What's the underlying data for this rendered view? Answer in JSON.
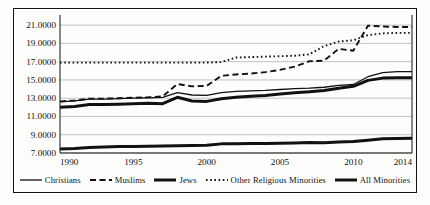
{
  "chart_data": {
    "type": "line",
    "title": "",
    "subtitle": "",
    "xlabel": "",
    "ylabel": "",
    "xlim": [
      1990,
      2014
    ],
    "ylim": [
      7.0,
      22.0
    ],
    "ytick_labels": [
      "21.0000",
      "19.0000",
      "17.0000",
      "15.0000",
      "13.0000",
      "11.0000",
      "9.0000",
      "7.0000"
    ],
    "ytick_values": [
      21.0,
      19.0,
      17.0,
      15.0,
      13.0,
      11.0,
      9.0,
      7.0
    ],
    "xtick_labels": [
      "1990",
      "1995",
      "2000",
      "2005",
      "2010",
      "2014"
    ],
    "xtick_values": [
      1990,
      1995,
      2000,
      2005,
      2010,
      2014
    ],
    "grid": "horizontal",
    "legend_position": "bottom",
    "x": [
      1990,
      1991,
      1992,
      1993,
      1994,
      1995,
      1996,
      1997,
      1998,
      1999,
      2000,
      2001,
      2002,
      2003,
      2004,
      2005,
      2006,
      2007,
      2008,
      2009,
      2010,
      2011,
      2012,
      2013,
      2014
    ],
    "series": [
      {
        "name": "Christians",
        "style": "solid-thin",
        "color": "#111111",
        "values": [
          12.6,
          12.7,
          12.9,
          12.9,
          12.95,
          13.0,
          13.05,
          13.1,
          13.6,
          13.35,
          13.3,
          13.6,
          13.75,
          13.8,
          13.85,
          13.95,
          14.05,
          14.1,
          14.2,
          14.4,
          14.5,
          15.35,
          15.8,
          15.9,
          15.9
        ]
      },
      {
        "name": "Muslims",
        "style": "dashed",
        "color": "#111111",
        "values": [
          12.65,
          12.75,
          12.95,
          12.95,
          13.0,
          13.05,
          13.1,
          13.2,
          14.55,
          14.3,
          14.35,
          15.45,
          15.6,
          15.7,
          15.85,
          16.1,
          16.45,
          17.05,
          17.1,
          18.4,
          18.2,
          20.95,
          20.85,
          20.8,
          20.8
        ]
      },
      {
        "name": "Jews",
        "style": "solid-thick",
        "color": "#111111",
        "values": [
          7.45,
          7.5,
          7.6,
          7.65,
          7.7,
          7.72,
          7.75,
          7.78,
          7.8,
          7.82,
          7.85,
          8.0,
          8.02,
          8.03,
          8.05,
          8.07,
          8.1,
          8.15,
          8.12,
          8.2,
          8.25,
          8.4,
          8.55,
          8.6,
          8.62
        ]
      },
      {
        "name": "Other Religious Minorities",
        "style": "dotted",
        "color": "#111111",
        "values": [
          16.9,
          16.9,
          16.9,
          16.9,
          16.9,
          16.9,
          16.9,
          16.9,
          16.9,
          16.9,
          16.9,
          16.95,
          17.45,
          17.5,
          17.55,
          17.6,
          17.65,
          17.8,
          18.7,
          19.2,
          19.35,
          19.9,
          20.1,
          20.15,
          20.15
        ]
      },
      {
        "name": "All Minorities",
        "style": "solid-thick",
        "color": "#111111",
        "values": [
          12.0,
          12.1,
          12.3,
          12.3,
          12.35,
          12.4,
          12.45,
          12.4,
          13.1,
          12.7,
          12.65,
          12.95,
          13.1,
          13.2,
          13.3,
          13.45,
          13.6,
          13.7,
          13.85,
          14.1,
          14.3,
          14.95,
          15.2,
          15.25,
          15.25
        ]
      }
    ]
  },
  "legend": {
    "items": [
      {
        "label": "Christians",
        "style": "solid-thin"
      },
      {
        "label": "Muslims",
        "style": "dashed"
      },
      {
        "label": "Jews",
        "style": "solid-thick"
      },
      {
        "label": "Other Religious Minorities",
        "style": "dotted"
      },
      {
        "label": "All Minorities",
        "style": "solid-thick"
      }
    ]
  }
}
